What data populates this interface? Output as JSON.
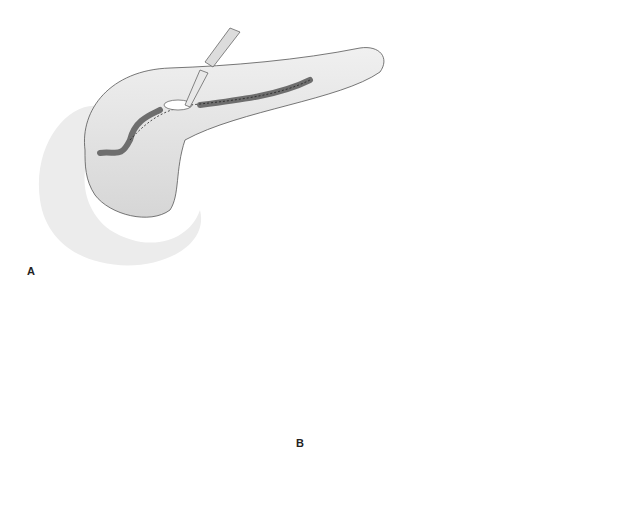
{
  "figure": {
    "panels": [
      {
        "label": "A",
        "description": "Pancreas with dilated main duct; scalpel incising along duct (dotted incision line)"
      },
      {
        "label": "B",
        "description": "Opened pancreatic duct with side-to-side Roux-en-Y limb anastomosis and sutures"
      }
    ]
  },
  "colors": {
    "outline": "#444444",
    "tissue": "#e6e6e6",
    "duct": "#6e6e6e",
    "background": "#ffffff"
  }
}
